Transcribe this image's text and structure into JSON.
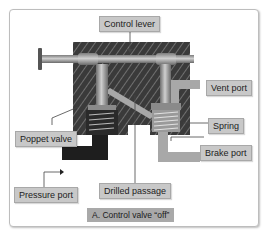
{
  "diagram": {
    "caption": "A. Control valve “off”",
    "labels": {
      "control_lever": "Control lever",
      "vent_port": "Vent port",
      "poppet_valve": "Poppet valve",
      "spring": "Spring",
      "brake_port": "Brake port",
      "pressure_port": "Pressure port",
      "drilled_passage": "Drilled passage"
    },
    "colors": {
      "body_dark": "#3a3a3a",
      "hatch": "#6e6e6e",
      "metal": "#9a9a9a",
      "metal_light": "#c6c6c6",
      "pressure_fluid": "#1e1e1e",
      "vent_passage": "#a8a8a8",
      "label_bg": "#c8c8c8",
      "caption_bg": "#a9a9a9"
    }
  }
}
